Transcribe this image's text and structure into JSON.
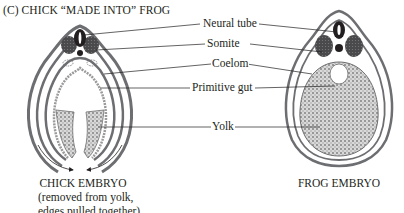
{
  "figure": {
    "title": "(C)  CHICK “MADE INTO” FROG",
    "labels": {
      "neural_tube": "Neural tube",
      "somite": "Somite",
      "coelom": "Coelom",
      "primitive_gut": "Primitive gut",
      "yolk": "Yolk"
    },
    "chick_caption": {
      "line1": "CHICK EMBRYO",
      "line2": "(removed from yolk,",
      "line3": "edges pulled together)"
    },
    "frog_caption": "FROG EMBRYO",
    "colors": {
      "ink": "#231f20",
      "tissue_gray": "#6d6e71",
      "dark_tissue": "#3a3a3c",
      "yolk_fill": "#bdbdbd"
    }
  }
}
